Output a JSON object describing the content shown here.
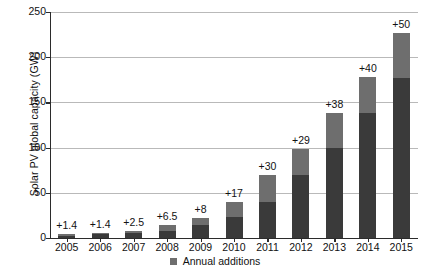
{
  "chart_data": {
    "type": "bar",
    "title": "",
    "subtitle": "",
    "xlabel": "",
    "ylabel": "Solar PV global capacity (GW)",
    "categories": [
      "2005",
      "2006",
      "2007",
      "2008",
      "2009",
      "2010",
      "2011",
      "2012",
      "2013",
      "2014",
      "2015"
    ],
    "series": [
      {
        "name": "Previous year total",
        "values": [
          2.6,
          4.0,
          5.4,
          7.9,
          14.4,
          23.0,
          40.0,
          70.0,
          100.0,
          138.0,
          177.0
        ]
      },
      {
        "name": "Annual additions",
        "values": [
          1.4,
          1.4,
          2.5,
          6.5,
          8.0,
          17.0,
          30.0,
          29.0,
          38.0,
          40.0,
          50.0
        ]
      }
    ],
    "totals": [
      4.0,
      5.4,
      7.9,
      14.4,
      22.4,
      40.0,
      70.0,
      99.0,
      138.0,
      178.0,
      227.0
    ],
    "data_labels": [
      "+1.4",
      "+1.4",
      "+2.5",
      "+6.5",
      "+8",
      "+17",
      "+30",
      "+29",
      "+38",
      "+40",
      "+50"
    ],
    "yticks": [
      0,
      50,
      100,
      150,
      200,
      250
    ],
    "ylim": [
      0,
      250
    ],
    "grid": true,
    "legend": [
      {
        "label": "Annual additions",
        "color": "#6e6e6e",
        "marker": "square"
      }
    ],
    "legend_position": "bottom-center",
    "colors": {
      "annual_additions": "#6e6e6e",
      "cumulative_base": "#3a3a3a",
      "gridline": "#b9b9b9",
      "axis": "#2b2b2b",
      "background": "#ffffff"
    }
  }
}
